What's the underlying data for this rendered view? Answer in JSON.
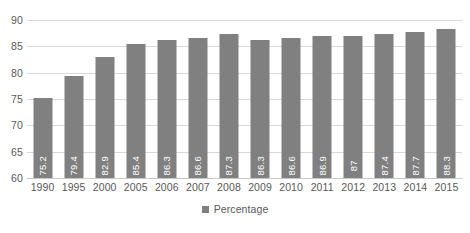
{
  "chart_data": {
    "type": "bar",
    "title": "",
    "subtitle": "",
    "xlabel": "",
    "ylabel": "",
    "categories": [
      "1990",
      "1995",
      "2000",
      "2005",
      "2006",
      "2007",
      "2008",
      "2009",
      "2010",
      "2011",
      "2012",
      "2013",
      "2014",
      "2015"
    ],
    "values": [
      75.2,
      79.4,
      82.9,
      85.4,
      86.3,
      86.6,
      87.3,
      86.3,
      86.6,
      86.9,
      87,
      87.4,
      87.7,
      88.3
    ],
    "value_labels": [
      "75.2",
      "79.4",
      "82.9",
      "85.4",
      "86.3",
      "86.6",
      "87.3",
      "86.3",
      "86.6",
      "86.9",
      "87",
      "87.4",
      "87.7",
      "88.3"
    ],
    "series": [
      {
        "name": "Percentage",
        "values": [
          75.2,
          79.4,
          82.9,
          85.4,
          86.3,
          86.6,
          87.3,
          86.3,
          86.6,
          86.9,
          87,
          87.4,
          87.7,
          88.3
        ]
      }
    ],
    "ylim": [
      60,
      90
    ],
    "yticks": [
      60,
      65,
      70,
      75,
      80,
      85,
      90
    ],
    "ytick_labels": [
      "60",
      "65",
      "70",
      "75",
      "80",
      "85",
      "90"
    ],
    "grid": "horizontal",
    "legend_position": "bottom-center",
    "bar_color": "#808080",
    "gridline_color": "#d9d9d9",
    "axis_text_color": "#595959",
    "data_label_color": "#ffffff",
    "data_label_rotation": -90,
    "background_color": "#ffffff"
  },
  "legend": {
    "entries": [
      {
        "label": "Percentage",
        "color": "#808080",
        "marker": "square-swatch"
      }
    ]
  }
}
